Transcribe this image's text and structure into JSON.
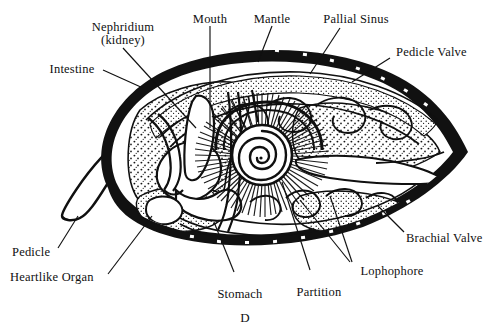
{
  "figure": {
    "caption": "D",
    "background": "#ffffff",
    "ink": "#101010"
  },
  "labels": {
    "nephridium": "Nephridium",
    "kidney": "(kidney)",
    "intestine": "Intestine",
    "mouth": "Mouth",
    "mantle": "Mantle",
    "pallial_sinus": "Pallial Sinus",
    "pedicle_valve": "Pedicle Valve",
    "brachial_valve": "Brachial Valve",
    "lophophore": "Lophophore",
    "partition": "Partition",
    "stomach": "Stomach",
    "heartlike_organ": "Heartlike Organ",
    "pedicle": "Pedicle"
  },
  "structures": {
    "shell_outline": "lens-shaped bivalve shell, apex right",
    "pedicle_stalk": "tapered stalk protruding lower-left",
    "lophophore_spiral": "central coiled spiral with radiating tentacles",
    "mantle_band": "thick black shell band with small white punctae",
    "stipple_tissue": "stippled soft tissue fill"
  }
}
